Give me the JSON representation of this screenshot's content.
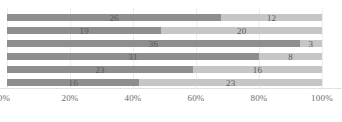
{
  "chart_data": {
    "type": "bar",
    "orientation": "horizontal",
    "stacked": true,
    "stack_mode": "percent",
    "title": "",
    "subtitle": "",
    "xlabel": "",
    "ylabel": "",
    "xlim": [
      0,
      100
    ],
    "grid": true,
    "legend": "none",
    "categories": [
      "row-1",
      "row-2",
      "row-3",
      "row-4",
      "row-5",
      "row-6"
    ],
    "tick_labels": [
      "0%",
      "20%",
      "40%",
      "60%",
      "80%",
      "100%"
    ],
    "tick_values": [
      0,
      20,
      40,
      60,
      80,
      100
    ],
    "series": [
      {
        "name": "segment-1",
        "color": "#8e8e8e",
        "labels": [
          "26",
          "19",
          "36",
          "31",
          "23",
          "16"
        ],
        "values": [
          26,
          19,
          36,
          31,
          23,
          16
        ],
        "percent_widths": [
          68,
          49,
          93,
          80,
          59,
          42
        ]
      },
      {
        "name": "segment-2",
        "color": "#c6c6c6",
        "labels": [
          "12",
          "20",
          "3",
          "8",
          "16",
          "23"
        ],
        "values": [
          12,
          20,
          3,
          8,
          16,
          23
        ],
        "percent_widths": [
          32,
          51,
          7,
          20,
          41,
          58
        ]
      }
    ]
  }
}
